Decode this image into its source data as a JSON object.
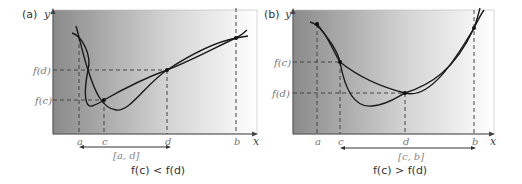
{
  "panels": [
    {
      "id": "a",
      "label": "(a)",
      "y_axis": "y",
      "x_axis": "x",
      "x_ticks": [
        "a",
        "c",
        "d",
        "b"
      ],
      "y_ticks": [
        "f(d)",
        "f(c)"
      ],
      "interval": "[a, d]",
      "caption": "f(c) < f(d)"
    },
    {
      "id": "b",
      "label": "(b)",
      "y_axis": "y",
      "x_axis": "x",
      "x_ticks": [
        "a",
        "c",
        "d",
        "b"
      ],
      "y_ticks": [
        "f(c)",
        "f(d)"
      ],
      "interval": "[c, b]",
      "caption": "f(c) > f(d)"
    }
  ],
  "colors": {
    "gradient_dark": "#8a8a8a",
    "gradient_light": "#ffffff",
    "curve": "#1a1a1a"
  }
}
